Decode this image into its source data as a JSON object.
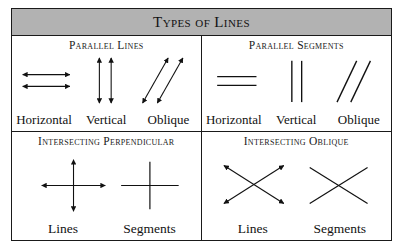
{
  "figure": {
    "title": "Types of Lines",
    "header_bg": "#b2b2b2",
    "border_color": "#1a1a1a",
    "ink_color": "#111111"
  },
  "cells": {
    "parallel_lines": {
      "title": "Parallel Lines",
      "labels": [
        "Horizontal",
        "Vertical",
        "Oblique"
      ],
      "figure_kind": "parallel-double-arrows"
    },
    "parallel_segments": {
      "title": "Parallel Segments",
      "labels": [
        "Horizontal",
        "Vertical",
        "Oblique"
      ],
      "figure_kind": "parallel-plain-segments"
    },
    "intersecting_perpendicular": {
      "title": "Intersecting Perpendicular",
      "labels": [
        "Lines",
        "Segments"
      ],
      "figure_kind": "perpendicular-cross"
    },
    "intersecting_oblique": {
      "title": "Intersecting Oblique",
      "labels": [
        "Lines",
        "Segments"
      ],
      "figure_kind": "oblique-cross"
    }
  }
}
